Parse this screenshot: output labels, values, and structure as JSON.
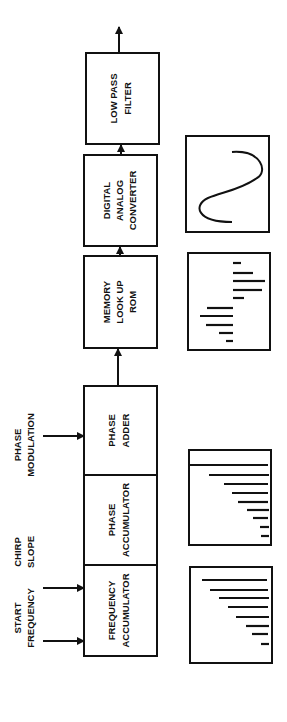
{
  "diagram": {
    "inputs": {
      "start_frequency": [
        "START",
        "FREQUENCY"
      ],
      "chirp_slope": [
        "CHIRP",
        "SLOPE"
      ],
      "phase_modulation": [
        "PHASE",
        "MODULATION"
      ]
    },
    "blocks": [
      {
        "id": "frequency-accumulator",
        "lines": [
          "FREQUENCY",
          "ACCUMULATOR"
        ]
      },
      {
        "id": "phase-accumulator",
        "lines": [
          "PHASE",
          "ACCUMULATOR"
        ]
      },
      {
        "id": "phase-adder",
        "lines": [
          "PHASE",
          "ADDER"
        ]
      },
      {
        "id": "memory-rom",
        "lines": [
          "MEMORY",
          "LOOK UP",
          "ROM"
        ]
      },
      {
        "id": "dac",
        "lines": [
          "DIGITAL",
          "ANALOG",
          "CONVERTER"
        ]
      },
      {
        "id": "low-pass-filter",
        "lines": [
          "LOW PASS",
          "FILTER"
        ]
      }
    ],
    "waveforms": [
      {
        "id": "frequency-ramp",
        "under": "frequency-accumulator",
        "bar_lengths": [
          0.88,
          0.78,
          0.68,
          0.58,
          0.48,
          0.38,
          0.28,
          0.14
        ]
      },
      {
        "id": "phase-ramp",
        "under": "phase-accumulator/phase-adder",
        "bar_lengths": [
          0.98,
          0.75,
          0.58,
          0.49,
          0.4,
          0.29,
          0.21,
          0.12,
          0.1
        ]
      },
      {
        "id": "rom-samples",
        "description": "signed sample amplitudes"
      },
      {
        "id": "sine-output",
        "under": "dac",
        "description": "analog sine wave"
      }
    ]
  }
}
